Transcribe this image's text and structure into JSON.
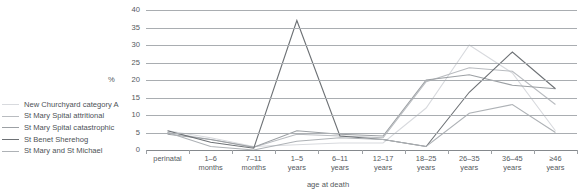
{
  "chart_data": {
    "type": "line",
    "title": "",
    "xlabel": "age at death",
    "ylabel": "%",
    "categories": [
      "perinatal",
      "1–6\nmonths",
      "7–11\nmonths",
      "1–5\nyears",
      "6–11\nyears",
      "12–17\nyears",
      "18–25\nyears",
      "26–35\nyears",
      "36–45\nyears",
      "≥46\nyears"
    ],
    "ylim": [
      0,
      40
    ],
    "yticks": [
      0,
      5,
      10,
      15,
      20,
      25,
      30,
      35,
      40
    ],
    "grid": true,
    "legend_position": "left",
    "series": [
      {
        "name": "New Churchyard category A",
        "color": "#d8dade",
        "values": [
          5.5,
          3.5,
          1.0,
          1.5,
          2.0,
          2.0,
          12.0,
          30.0,
          22.0,
          5.5
        ]
      },
      {
        "name": "St Mary Spital attritional",
        "color": "#b9bcc0",
        "values": [
          5.0,
          3.0,
          0.8,
          4.5,
          4.0,
          3.5,
          19.5,
          23.5,
          22.5,
          13.0
        ]
      },
      {
        "name": "St Mary Spital catastrophic",
        "color": "#9ca0a4",
        "values": [
          4.5,
          3.0,
          0.8,
          5.5,
          4.5,
          4.0,
          20.0,
          21.5,
          18.5,
          17.5
        ]
      },
      {
        "name": "St Benet Sherehog",
        "color": "#6d7175",
        "values": [
          5.5,
          2.2,
          0.5,
          37.0,
          4.0,
          3.0,
          1.0,
          16.5,
          28.0,
          17.5
        ]
      },
      {
        "name": "St Mary and St Michael",
        "color": "#aeb2b6",
        "values": [
          5.0,
          1.0,
          0.0,
          2.5,
          3.5,
          3.0,
          1.0,
          10.5,
          13.0,
          5.0
        ]
      }
    ]
  },
  "axis": {
    "y_unit": "%",
    "y_ticks": [
      "0",
      "5",
      "10",
      "15",
      "20",
      "25",
      "30",
      "35",
      "40"
    ],
    "x_title": "age at death"
  },
  "legend": {
    "items": [
      {
        "label": "New Churchyard category A"
      },
      {
        "label": "St Mary Spital attritional"
      },
      {
        "label": "St Mary Spital catastrophic"
      },
      {
        "label": "St Benet Sherehog"
      },
      {
        "label": "St Mary and St Michael"
      }
    ]
  }
}
